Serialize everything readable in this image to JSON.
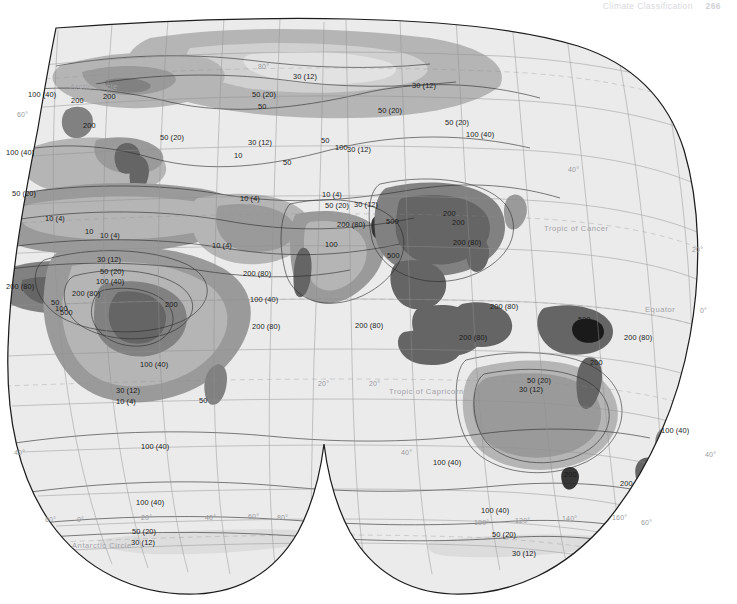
{
  "running_head": {
    "title": "Climate Classification",
    "page_number": "266"
  },
  "map": {
    "name": "world-precipitation-map",
    "projection": "interrupted-goode-homolosine-eastern-hemisphere",
    "units_note": "centimeters (inches)",
    "reference_lines": [
      {
        "id": "arctic-circle",
        "label": "Arctic Circle",
        "x": 70,
        "y": 74
      },
      {
        "id": "tropic-of-cancer",
        "label": "Tropic of Cancer",
        "x": 544,
        "y": 216
      },
      {
        "id": "equator",
        "label": "Equator",
        "x": 645,
        "y": 297
      },
      {
        "id": "tropic-of-capricorn",
        "label": "Tropic of Capricorn",
        "x": 389,
        "y": 379
      },
      {
        "id": "antarctic-circle",
        "label": "Antarctic Circle",
        "x": 72,
        "y": 533
      }
    ],
    "graticule_labels": [
      {
        "text": "80°",
        "x": 258,
        "y": 55
      },
      {
        "text": "60°",
        "x": 17,
        "y": 103
      },
      {
        "text": "40°",
        "x": 568,
        "y": 158
      },
      {
        "text": "20°",
        "x": 692,
        "y": 238
      },
      {
        "text": "0°",
        "x": 700,
        "y": 299
      },
      {
        "text": "20°",
        "x": 318,
        "y": 372
      },
      {
        "text": "20°",
        "x": 369,
        "y": 372
      },
      {
        "text": "40°",
        "x": 14,
        "y": 441
      },
      {
        "text": "40°",
        "x": 401,
        "y": 441
      },
      {
        "text": "40°",
        "x": 705,
        "y": 443
      },
      {
        "text": "60°",
        "x": 45,
        "y": 508
      },
      {
        "text": "0°",
        "x": 77,
        "y": 508
      },
      {
        "text": "20°",
        "x": 141,
        "y": 506
      },
      {
        "text": "40°",
        "x": 205,
        "y": 506
      },
      {
        "text": "60°",
        "x": 248,
        "y": 505
      },
      {
        "text": "80°",
        "x": 277,
        "y": 506
      },
      {
        "text": "100°",
        "x": 474,
        "y": 511
      },
      {
        "text": "120°",
        "x": 515,
        "y": 509
      },
      {
        "text": "140°",
        "x": 562,
        "y": 507
      },
      {
        "text": "160°",
        "x": 612,
        "y": 506
      },
      {
        "text": "60°",
        "x": 641,
        "y": 511
      }
    ],
    "isohyet_labels": [
      {
        "text": "30 (12)",
        "x": 293,
        "y": 64
      },
      {
        "text": "30 (12)",
        "x": 412,
        "y": 73
      },
      {
        "text": "100 (40)",
        "x": 28,
        "y": 82
      },
      {
        "text": "200",
        "x": 71,
        "y": 88
      },
      {
        "text": "200",
        "x": 103,
        "y": 84
      },
      {
        "text": "50 (20)",
        "x": 252,
        "y": 82
      },
      {
        "text": "50",
        "x": 258,
        "y": 94
      },
      {
        "text": "50 (20)",
        "x": 378,
        "y": 98
      },
      {
        "text": "50 (20)",
        "x": 445,
        "y": 110
      },
      {
        "text": "200",
        "x": 83,
        "y": 113
      },
      {
        "text": "50 (20)",
        "x": 160,
        "y": 125
      },
      {
        "text": "50",
        "x": 321,
        "y": 128
      },
      {
        "text": "30 (12)",
        "x": 248,
        "y": 130
      },
      {
        "text": "100",
        "x": 335,
        "y": 135
      },
      {
        "text": "30 (12)",
        "x": 347,
        "y": 137
      },
      {
        "text": "100 (40)",
        "x": 6,
        "y": 140
      },
      {
        "text": "10",
        "x": 234,
        "y": 143
      },
      {
        "text": "50",
        "x": 283,
        "y": 150
      },
      {
        "text": "100 (40)",
        "x": 466,
        "y": 122
      },
      {
        "text": "50 (20)",
        "x": 12,
        "y": 181
      },
      {
        "text": "10 (4)",
        "x": 240,
        "y": 186
      },
      {
        "text": "10 (4)",
        "x": 322,
        "y": 182
      },
      {
        "text": "50 (20)",
        "x": 325,
        "y": 193
      },
      {
        "text": "30 (12)",
        "x": 354,
        "y": 192
      },
      {
        "text": "200 (80)",
        "x": 337,
        "y": 212
      },
      {
        "text": "500",
        "x": 386,
        "y": 209
      },
      {
        "text": "200",
        "x": 443,
        "y": 201
      },
      {
        "text": "200",
        "x": 452,
        "y": 210
      },
      {
        "text": "10 (4)",
        "x": 45,
        "y": 206
      },
      {
        "text": "10",
        "x": 85,
        "y": 219
      },
      {
        "text": "10 (4)",
        "x": 100,
        "y": 223
      },
      {
        "text": "10 (4)",
        "x": 212,
        "y": 233
      },
      {
        "text": "100",
        "x": 325,
        "y": 232
      },
      {
        "text": "30 (12)",
        "x": 97,
        "y": 247
      },
      {
        "text": "50 (20)",
        "x": 100,
        "y": 259
      },
      {
        "text": "200 (80)",
        "x": 453,
        "y": 230
      },
      {
        "text": "500",
        "x": 387,
        "y": 243
      },
      {
        "text": "100 (40)",
        "x": 96,
        "y": 269
      },
      {
        "text": "200 (80)",
        "x": 6,
        "y": 274
      },
      {
        "text": "200 (80)",
        "x": 72,
        "y": 281
      },
      {
        "text": "50",
        "x": 51,
        "y": 290
      },
      {
        "text": "100",
        "x": 55,
        "y": 296
      },
      {
        "text": "500",
        "x": 60,
        "y": 300
      },
      {
        "text": "200",
        "x": 165,
        "y": 292
      },
      {
        "text": "200 (80)",
        "x": 243,
        "y": 261
      },
      {
        "text": "100 (40)",
        "x": 250,
        "y": 287
      },
      {
        "text": "200 (80)",
        "x": 252,
        "y": 314
      },
      {
        "text": "200 (80)",
        "x": 355,
        "y": 313
      },
      {
        "text": "200 (80)",
        "x": 490,
        "y": 294
      },
      {
        "text": "500",
        "x": 578,
        "y": 307
      },
      {
        "text": "200 (80)",
        "x": 459,
        "y": 325
      },
      {
        "text": "200 (80)",
        "x": 624,
        "y": 325
      },
      {
        "text": "100 (40)",
        "x": 140,
        "y": 352
      },
      {
        "text": "30 (12)",
        "x": 116,
        "y": 378
      },
      {
        "text": "10 (4)",
        "x": 116,
        "y": 389
      },
      {
        "text": "50",
        "x": 199,
        "y": 388
      },
      {
        "text": "50 (20)",
        "x": 527,
        "y": 368
      },
      {
        "text": "30 (12)",
        "x": 519,
        "y": 377
      },
      {
        "text": "200",
        "x": 590,
        "y": 350
      },
      {
        "text": "100 (40)",
        "x": 661,
        "y": 418
      },
      {
        "text": "200",
        "x": 564,
        "y": 462
      },
      {
        "text": "200",
        "x": 620,
        "y": 471
      },
      {
        "text": "100 (40)",
        "x": 141,
        "y": 434
      },
      {
        "text": "100 (40)",
        "x": 433,
        "y": 450
      },
      {
        "text": "100 (40)",
        "x": 136,
        "y": 490
      },
      {
        "text": "100 (40)",
        "x": 481,
        "y": 498
      },
      {
        "text": "50 (20)",
        "x": 132,
        "y": 519
      },
      {
        "text": "30 (12)",
        "x": 131,
        "y": 530
      },
      {
        "text": "50 (20)",
        "x": 492,
        "y": 522
      },
      {
        "text": "30 (12)",
        "x": 512,
        "y": 541
      }
    ],
    "colors": {
      "ocean": "#ebebeb",
      "tone_lightest": "#e2e2e2",
      "tone_light": "#cfcfcf",
      "tone_medium": "#b4b4b4",
      "tone_dark": "#989898",
      "tone_darker": "#7e7e7e",
      "tone_darkest": "#5f5f5f",
      "outline": "#1d1d1d",
      "graticule": "#8f8f93",
      "contour": "#2a2a2a"
    }
  }
}
